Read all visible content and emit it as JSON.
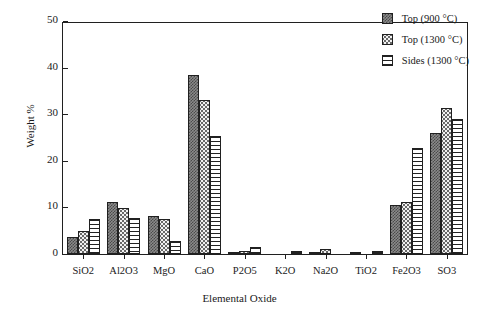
{
  "chart_data": {
    "type": "bar",
    "title": "",
    "xlabel": "Elemental Oxide",
    "ylabel": "Weight %",
    "ylim": [
      0,
      50
    ],
    "yticks": [
      0,
      10,
      20,
      30,
      40,
      50
    ],
    "grid": false,
    "legend_position": "top-right",
    "categories": [
      "SiO2",
      "Al2O3",
      "MgO",
      "CaO",
      "P2O5",
      "K2O",
      "Na2O",
      "TiO2",
      "Fe2O3",
      "SO3"
    ],
    "series": [
      {
        "name": "Top (900 °C)",
        "pattern": "dark-checker",
        "values": [
          3.7,
          11.2,
          8.1,
          38.5,
          0.2,
          0.0,
          0.2,
          0.3,
          10.6,
          26.0
        ]
      },
      {
        "name": "Top (1300 °C)",
        "pattern": "light-dots",
        "values": [
          5.0,
          9.9,
          7.5,
          33.0,
          0.6,
          0.0,
          1.1,
          0.0,
          11.1,
          31.4
        ]
      },
      {
        "name": "Sides (1300 °C)",
        "pattern": "horizontal-lines",
        "values": [
          7.6,
          7.7,
          2.9,
          25.3,
          1.4,
          0.6,
          0.0,
          0.6,
          22.7,
          29.0
        ]
      }
    ]
  },
  "axes": {
    "ylabel": "Weight %",
    "xlabel": "Elemental Oxide",
    "ytick_labels": [
      "0",
      "10",
      "20",
      "30",
      "40",
      "50"
    ],
    "xtick_labels": [
      "SiO2",
      "Al2O3",
      "MgO",
      "CaO",
      "P2O5",
      "K2O",
      "Na2O",
      "TiO2",
      "Fe2O3",
      "SO3"
    ]
  },
  "legend": {
    "items": [
      {
        "label": "Top (900 °C)"
      },
      {
        "label": "Top (1300 °C)"
      },
      {
        "label": "Sides (1300 °C)"
      }
    ]
  },
  "colors": {
    "axis": "#202020",
    "series_dark": "#6a6a6a",
    "series_light": "#f2f2f2",
    "series_lines": "#ffffff",
    "background": "#ffffff"
  }
}
